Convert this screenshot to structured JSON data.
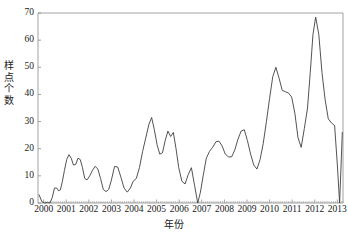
{
  "chart_data": {
    "type": "line",
    "title": "",
    "xlabel": "年份",
    "ylabel": "样点个数",
    "ylabel_chars": [
      "样",
      "点",
      "个",
      "数"
    ],
    "xlim": [
      1999.75,
      2013.25
    ],
    "ylim": [
      0,
      70
    ],
    "ytick_labels": [
      "0",
      "10",
      "20",
      "30",
      "40",
      "50",
      "60",
      "70"
    ],
    "ytick_values": [
      0,
      10,
      20,
      30,
      40,
      50,
      60,
      70
    ],
    "xtick_labels": [
      "2000",
      "2001",
      "2002",
      "2003",
      "2004",
      "2005",
      "2006",
      "2007",
      "2008",
      "2009",
      "2010",
      "2011",
      "2012",
      "2013"
    ],
    "xtick_values": [
      2000,
      2001,
      2002,
      2003,
      2004,
      2005,
      2006,
      2007,
      2008,
      2009,
      2010,
      2011,
      2012,
      2013
    ],
    "minor_xticks_per_year": 12,
    "grid": false,
    "legend": false,
    "line_color": "#3f3f3f",
    "line_width": 0.9,
    "axis_color": "#8a8a8a",
    "background": "#ffffff",
    "series": [
      {
        "name": "样点个数",
        "x": [
          1999.8,
          1999.92,
          2000.05,
          2000.17,
          2000.28,
          2000.38,
          2000.48,
          2000.58,
          2000.66,
          2000.74,
          2000.83,
          2000.92,
          2001.02,
          2001.12,
          2001.22,
          2001.32,
          2001.42,
          2001.52,
          2001.62,
          2001.72,
          2001.82,
          2001.92,
          2002.04,
          2002.16,
          2002.28,
          2002.4,
          2002.52,
          2002.64,
          2002.76,
          2002.88,
          2003.0,
          2003.14,
          2003.28,
          2003.42,
          2003.56,
          2003.7,
          2003.84,
          2003.96,
          2004.1,
          2004.24,
          2004.38,
          2004.52,
          2004.66,
          2004.78,
          2004.9,
          2005.02,
          2005.14,
          2005.26,
          2005.38,
          2005.5,
          2005.62,
          2005.74,
          2005.86,
          2005.98,
          2006.12,
          2006.26,
          2006.4,
          2006.54,
          2006.68,
          2006.82,
          2006.94,
          2007.06,
          2007.2,
          2007.34,
          2007.48,
          2007.62,
          2007.76,
          2007.9,
          2008.04,
          2008.18,
          2008.32,
          2008.46,
          2008.6,
          2008.74,
          2008.88,
          2009.02,
          2009.16,
          2009.3,
          2009.44,
          2009.58,
          2009.72,
          2009.86,
          2010.0,
          2010.14,
          2010.28,
          2010.42,
          2010.56,
          2010.7,
          2010.84,
          2010.98,
          2011.12,
          2011.26,
          2011.4,
          2011.54,
          2011.68,
          2011.8,
          2011.92,
          2012.04,
          2012.18,
          2012.32,
          2012.46,
          2012.6,
          2012.74,
          2012.88,
          2013.0,
          2013.1,
          2013.22
        ],
        "values": [
          3.0,
          0.5,
          0.0,
          0.2,
          0.0,
          2.0,
          5.5,
          5.5,
          4.5,
          4.8,
          8.0,
          12.0,
          16.0,
          17.8,
          16.5,
          14.0,
          14.2,
          16.5,
          16.0,
          13.0,
          9.0,
          8.5,
          10.0,
          12.0,
          13.5,
          12.5,
          9.0,
          5.0,
          4.2,
          5.0,
          8.5,
          13.5,
          13.2,
          9.5,
          5.5,
          4.0,
          5.5,
          8.0,
          9.0,
          13.0,
          19.0,
          24.0,
          29.0,
          31.5,
          27.0,
          21.5,
          18.0,
          18.5,
          23.0,
          26.5,
          24.5,
          26.0,
          20.0,
          13.0,
          8.0,
          7.0,
          10.5,
          13.0,
          6.5,
          0.0,
          4.0,
          10.0,
          16.5,
          19.0,
          20.5,
          22.5,
          22.8,
          21.0,
          18.0,
          17.0,
          17.0,
          19.5,
          23.5,
          26.5,
          27.0,
          23.0,
          18.0,
          14.0,
          12.5,
          16.0,
          22.0,
          30.0,
          38.5,
          46.5,
          50.0,
          46.0,
          41.5,
          41.0,
          40.5,
          39.0,
          33.0,
          24.0,
          20.5,
          27.5,
          35.0,
          48.0,
          62.0,
          68.5,
          62.0,
          48.0,
          38.0,
          31.0,
          29.5,
          28.5,
          14.0,
          0.0,
          26.0
        ]
      }
    ]
  },
  "axes": {
    "plot_left_px": 38,
    "plot_right_px": 343,
    "plot_top_px": 13,
    "plot_bottom_px": 203
  }
}
